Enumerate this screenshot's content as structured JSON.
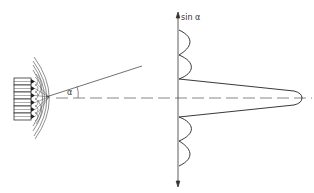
{
  "diagram": {
    "title": "",
    "labels": {
      "axis_label": "sin α",
      "angle_label": "α"
    },
    "components": {
      "transducer_array": {
        "element_count": 6
      },
      "wavefronts": {
        "arc_count": 4
      },
      "beam_line": {
        "description": "ray at angle α above centerline"
      },
      "centerline": {
        "style": "dashed"
      },
      "vertical_axis": {
        "arrows": "both ends"
      },
      "directivity_pattern": {
        "main_lobe": "single large lobe along centerline",
        "side_lobes_above": 2,
        "side_lobes_below": 2
      }
    },
    "colors": {
      "stroke": "#333333",
      "dashed": "#555555",
      "background": "#ffffff"
    }
  }
}
